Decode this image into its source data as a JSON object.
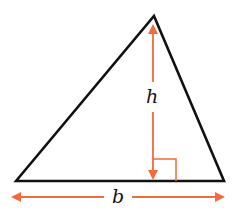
{
  "diagram": {
    "shape": "triangle",
    "labels": {
      "height": "h",
      "base": "b"
    },
    "colors": {
      "outline": "#111111",
      "accent": "#f26b3a"
    },
    "annotations": [
      "right-angle-marker",
      "height-arrow",
      "base-arrow"
    ]
  }
}
